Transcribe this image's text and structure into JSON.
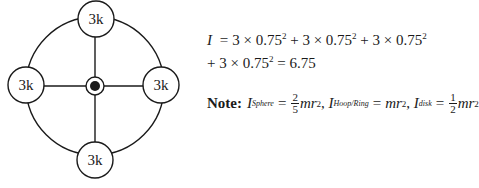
{
  "diagram": {
    "masses": [
      {
        "position": "top",
        "label": "3k"
      },
      {
        "position": "left",
        "label": "3k"
      },
      {
        "position": "right",
        "label": "3k"
      },
      {
        "position": "bottom",
        "label": "3k"
      }
    ],
    "center": "axis-pivot"
  },
  "equation": {
    "line1": {
      "lhs": "I",
      "eq": "=",
      "terms": [
        "3 × 0.75",
        "+ 3 × 0.75",
        "+ 3 × 0.75"
      ],
      "exp": "2"
    },
    "line2": {
      "term": "+ 3 × 0.75",
      "exp": "2",
      "result": "= 6.75"
    }
  },
  "note": {
    "label": "Note:",
    "sphere": {
      "sym": "I",
      "sub": "Sphere",
      "eq": "=",
      "num": "2",
      "den": "5",
      "rest": "mr",
      "exp": "2",
      "sep": ","
    },
    "hoop": {
      "sym": "I",
      "sub": "Hoop/Ring",
      "eq": "=",
      "rest": "mr",
      "exp": "2",
      "sep": ","
    },
    "disk": {
      "sym": "I",
      "sub": "disk",
      "eq": "=",
      "num": "1",
      "den": "2",
      "rest": "mr",
      "exp": "2"
    }
  }
}
